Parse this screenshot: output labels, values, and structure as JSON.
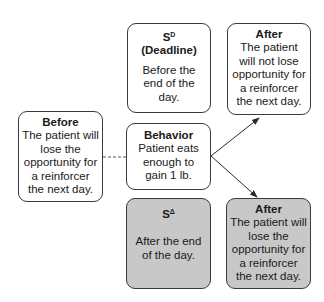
{
  "diagram": {
    "type": "three-term contingency",
    "boxes": {
      "sd": {
        "symbol": "S",
        "superscript": "D",
        "title": "(Deadline)",
        "body": "Before the end of the day.",
        "fill": "#ffffff"
      },
      "after_top": {
        "title": "After",
        "body": "The patient will not lose opportunity for a reinforcer the next day.",
        "fill": "#ffffff"
      },
      "before": {
        "title": "Before",
        "body": "The patient will lose the opportunity for a reinforcer the next day.",
        "fill": "#ffffff"
      },
      "behavior": {
        "title": "Behavior",
        "body": "Patient eats enough to gain 1 lb.",
        "fill": "#ffffff"
      },
      "sdelta": {
        "symbol": "S",
        "superscript": "Δ",
        "body": "After the end of the day.",
        "fill": "#c8c8c8"
      },
      "after_bottom": {
        "title": "After",
        "body": "The patient will lose the opportunity for a reinforcer the next day.",
        "fill": "#c8c8c8"
      }
    },
    "connections": [
      {
        "from": "before",
        "to": "behavior",
        "style": "dashed"
      },
      {
        "from": "behavior",
        "to": "after_top",
        "style": "arrow"
      },
      {
        "from": "behavior",
        "to": "after_bottom",
        "style": "arrow"
      }
    ],
    "colors": {
      "stroke": "#3a3a3a",
      "gray_fill": "#c8c8c8",
      "white_fill": "#ffffff"
    }
  }
}
